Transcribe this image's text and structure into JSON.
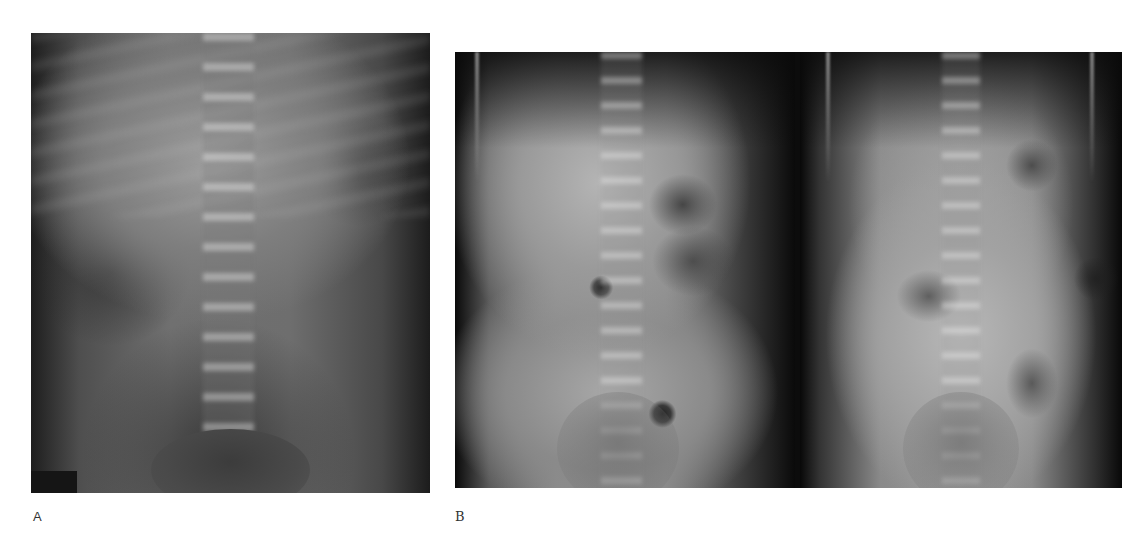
{
  "figure": {
    "panels": [
      {
        "label": "A",
        "description": "Abdominal radiograph (anteroposterior supine view)",
        "images": 1
      },
      {
        "label": "B",
        "description": "Two abdominal radiographs side by side",
        "images": 2
      }
    ]
  },
  "colors": {
    "background": "#ffffff",
    "label_text": "#333333"
  }
}
